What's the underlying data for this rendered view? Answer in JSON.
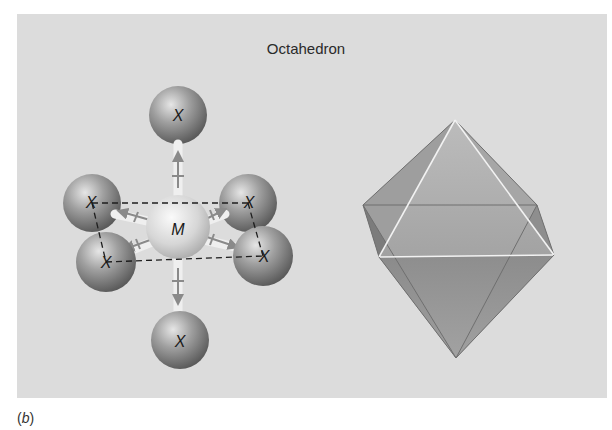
{
  "figure": {
    "title": "Octahedron",
    "caption_open": "(",
    "caption_letter": "b",
    "caption_close": ")"
  },
  "molecule": {
    "central_atom": {
      "label": "M",
      "color": "#e2e2e2"
    },
    "ligands": [
      {
        "position": "top",
        "label": "X"
      },
      {
        "position": "left-back",
        "label": "X"
      },
      {
        "position": "left-front",
        "label": "X"
      },
      {
        "position": "right-back",
        "label": "X"
      },
      {
        "position": "right-front",
        "label": "X"
      },
      {
        "position": "bottom",
        "label": "X"
      }
    ],
    "ligand_color": "#8e8e8e",
    "bond_arrow_color": "#8a8a8a",
    "edge_style": "dashed"
  },
  "polyhedron": {
    "shape": "octahedron",
    "face_color": "#a8a8a8",
    "edge_color": "#f2f2f2"
  },
  "colors": {
    "panel_background": "#dcdcdc",
    "page_background": "#ffffff"
  }
}
